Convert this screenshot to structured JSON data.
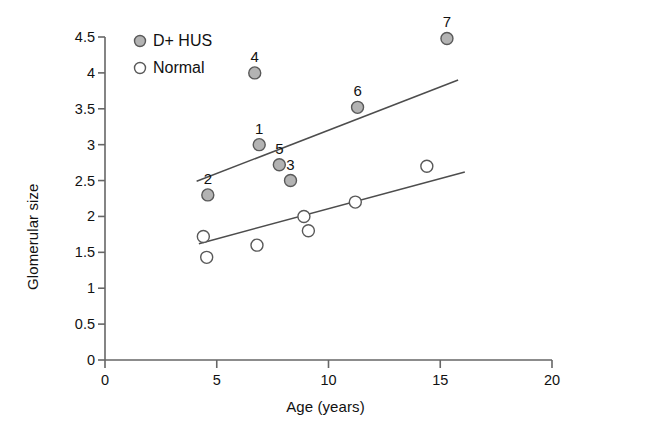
{
  "chart_data": {
    "type": "scatter",
    "title": "",
    "xlabel": "Age (years)",
    "ylabel": "Glomerular size",
    "xlim": [
      0,
      20
    ],
    "ylim": [
      0,
      4.5
    ],
    "xticks": [
      "0",
      "5",
      "10",
      "15",
      "20"
    ],
    "yticks": [
      "0",
      "0.5",
      "1",
      "1.5",
      "2",
      "2.5",
      "3",
      "3.5",
      "4",
      "4.5"
    ],
    "grid": false,
    "legend_position": "top-left",
    "series": [
      {
        "name": "D+ HUS",
        "marker": "filled-circle",
        "color": "#b3b3b3",
        "edge_color": "#595959",
        "points": [
          {
            "label": "2",
            "x": 4.6,
            "y": 2.3
          },
          {
            "label": "4",
            "x": 6.7,
            "y": 4.0
          },
          {
            "label": "1",
            "x": 6.9,
            "y": 3.0
          },
          {
            "label": "5",
            "x": 7.8,
            "y": 2.72
          },
          {
            "label": "3",
            "x": 8.3,
            "y": 2.5
          },
          {
            "label": "6",
            "x": 11.3,
            "y": 3.52
          },
          {
            "label": "7",
            "x": 15.3,
            "y": 4.48
          }
        ],
        "trendline": {
          "x1": 4.1,
          "y1": 2.49,
          "x2": 15.8,
          "y2": 3.9
        }
      },
      {
        "name": "Normal",
        "marker": "open-circle",
        "color": "#ffffff",
        "edge_color": "#595959",
        "points": [
          {
            "label": "",
            "x": 4.4,
            "y": 1.72
          },
          {
            "label": "",
            "x": 4.55,
            "y": 1.43
          },
          {
            "label": "",
            "x": 6.8,
            "y": 1.6
          },
          {
            "label": "",
            "x": 8.9,
            "y": 2.0
          },
          {
            "label": "",
            "x": 9.1,
            "y": 1.8
          },
          {
            "label": "",
            "x": 11.2,
            "y": 2.2
          },
          {
            "label": "",
            "x": 14.4,
            "y": 2.7
          }
        ],
        "trendline": {
          "x1": 4.2,
          "y1": 1.62,
          "x2": 16.1,
          "y2": 2.62
        }
      }
    ]
  },
  "legend": {
    "items": [
      {
        "label": "D+ HUS",
        "marker": "filled-circle"
      },
      {
        "label": "Normal",
        "marker": "open-circle"
      }
    ]
  },
  "colors": {
    "axis": "#666666",
    "marker_fill": "#b3b3b3",
    "marker_edge": "#595959",
    "trendline": "#4d4d4d",
    "text": "#111111",
    "background": "#ffffff"
  }
}
